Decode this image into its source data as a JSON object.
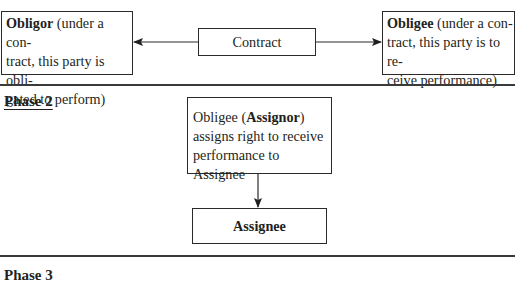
{
  "phase1": {
    "obligor": {
      "title": "Obligor",
      "line1_rest": " (under a con-",
      "line2": "tract, this party is obli-",
      "line3": "gated to perform)"
    },
    "contract": {
      "label": "Contract"
    },
    "obligee": {
      "title": "Obligee",
      "line1_rest": " (under a con-",
      "line2": "tract, this party is to re-",
      "line3": "ceive performance)"
    }
  },
  "phase2": {
    "label": "Phase 2",
    "assignor": {
      "line1_pre": "Obligee (",
      "line1_bold": "Assignor",
      "line1_post": ")",
      "line2": "assigns right to receive",
      "line3": "performance to Assignee"
    },
    "assignee": {
      "label": "Assignee"
    }
  },
  "phase3": {
    "label": "Phase 3"
  },
  "colors": {
    "line": "#2a2a2a",
    "text": "#231f20",
    "background": "#ffffff"
  }
}
